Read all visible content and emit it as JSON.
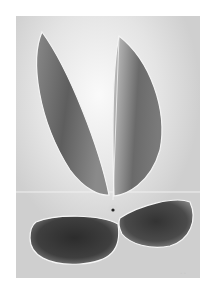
{
  "artwork": {
    "description": "Grayscale abstract drawing: two tall leaf shapes rising from a small dot above a horizontal line, with two dark rounded oval shapes below",
    "colors": {
      "paper": "#ffffff",
      "ground": "#d4d4d4",
      "ground_light": "#f2f2f2",
      "leaf_dark": "#6a6a6a",
      "oval_dark": "#3a3a3a",
      "outline": "#f4f4f4"
    }
  }
}
